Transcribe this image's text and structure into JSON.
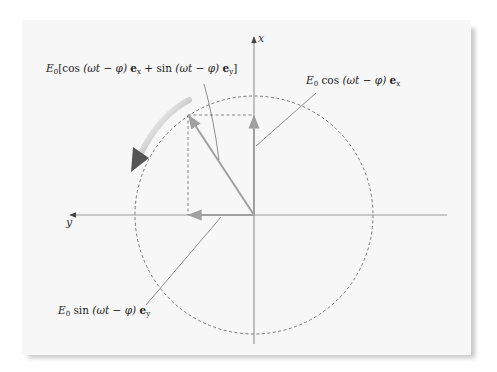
{
  "figure": {
    "axes": {
      "vertical_label": "x",
      "horizontal_label": "y"
    },
    "labels": {
      "resultant": "E0[cos(ωt − φ) ex + sin(ωt − φ) ey]",
      "x_component": "E0 cos(ωt − φ) ex",
      "y_component": "E0 sin(ωt − φ) ey"
    },
    "label_parts": {
      "E": "E",
      "sub0": "0",
      "cos": "cos",
      "sin": "sin",
      "arg": "(ωt − φ)",
      "ex": "e",
      "ex_sub": "x",
      "ey": "e",
      "ey_sub": "y",
      "plus": "+",
      "lbr": "[",
      "rbr": "]"
    },
    "rotation_direction": "counter-clockwise",
    "colors": {
      "background": "#f7f7f7",
      "axis": "#999999",
      "vector": "#999999",
      "circle": "#444444",
      "rotation_arrow": "#666666",
      "text": "#222222"
    }
  }
}
